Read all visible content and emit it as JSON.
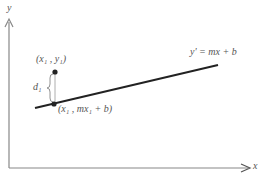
{
  "diagram": {
    "type": "linear-regression-residual",
    "axes": {
      "x_label": "x",
      "y_label": "y"
    },
    "line": {
      "equation": "y' = mx + b",
      "color": "#222222"
    },
    "points": {
      "observed": {
        "label": "(x₁ , y₁)"
      },
      "predicted": {
        "label": "(x₁ , mx₁ + b)"
      }
    },
    "residual": {
      "label": "d₁"
    },
    "colors": {
      "axis": "#888888",
      "text": "#555555",
      "point": "#222222"
    }
  }
}
